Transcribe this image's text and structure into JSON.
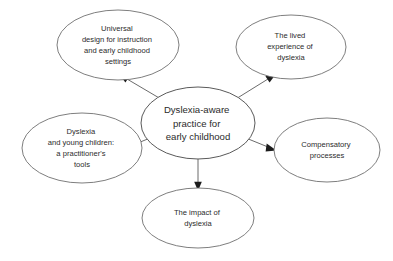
{
  "diagram": {
    "type": "concept-map",
    "layout": "radial hub-and-spoke",
    "background_color": "#ffffff",
    "stroke_color": "#5a5a5a",
    "text_color": "#2b2b2b",
    "arrow_color": "#1c1c1c",
    "arrow_direction": "from center outward to each satellite",
    "central_node": {
      "id": "central",
      "lines": [
        "Dyslexia-aware",
        "practice for",
        "early childhood"
      ],
      "full_text": "Dyslexia-aware practice for early childhood"
    },
    "satellite_nodes": [
      {
        "id": "universal-design",
        "position": "top-left",
        "lines": [
          "Universal",
          "design for instruction",
          "and early childhood",
          "settings"
        ],
        "full_text": "Universal design for instruction and early childhood settings"
      },
      {
        "id": "lived-experience",
        "position": "top-right",
        "lines": [
          "The lived",
          "experience of",
          "dyslexia"
        ],
        "full_text": "The lived experience of dyslexia"
      },
      {
        "id": "practitioners-tools",
        "position": "left",
        "lines": [
          "Dyslexia",
          "and young children:",
          "a practitioner's",
          "tools"
        ],
        "full_text": "Dyslexia and young children: a practitioner's tools"
      },
      {
        "id": "compensatory-processes",
        "position": "right",
        "lines": [
          "Compensatory",
          "processes"
        ],
        "full_text": "Compensatory processes"
      },
      {
        "id": "impact-of-dyslexia",
        "position": "bottom",
        "lines": [
          "The impact of",
          "dyslexia"
        ],
        "full_text": "The impact of dyslexia"
      }
    ],
    "connectors": [
      {
        "from": "central",
        "to": "universal-design"
      },
      {
        "from": "central",
        "to": "lived-experience"
      },
      {
        "from": "central",
        "to": "practitioners-tools"
      },
      {
        "from": "central",
        "to": "compensatory-processes"
      },
      {
        "from": "central",
        "to": "impact-of-dyslexia"
      }
    ]
  }
}
